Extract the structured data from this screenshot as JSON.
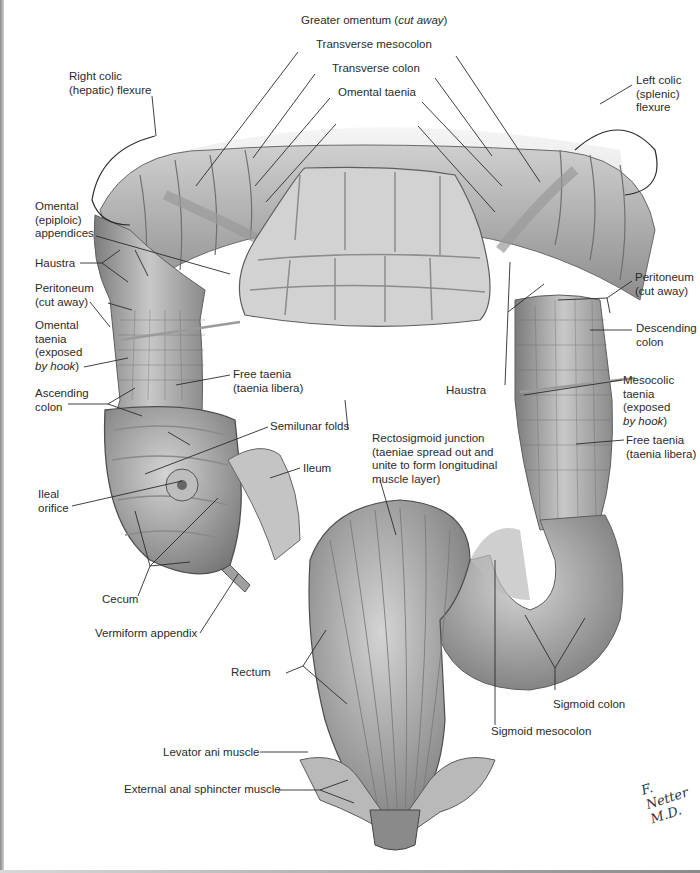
{
  "figure": {
    "signature": "F. Netter M.D.",
    "colors": {
      "background": "#ffffff",
      "ink": "#2b2b2b",
      "tissue_light": "#d9d9d9",
      "tissue_mid": "#a8a8a8",
      "tissue_dark": "#6e6e6e"
    }
  },
  "labels": {
    "greater_omentum": {
      "text": "Greater omentum (",
      "italic": "cut away",
      "suffix": ")"
    },
    "transverse_mesocolon": "Transverse mesocolon",
    "transverse_colon": "Transverse colon",
    "omental_taenia_top": "Omental taenia",
    "right_colic_flexure": {
      "line1": "Right colic",
      "line2": "(hepatic) flexure"
    },
    "left_colic_flexure": {
      "line1": "Left colic",
      "line2": "(splenic)",
      "line3": "flexure"
    },
    "omental_appendices": {
      "line1": "Omental",
      "line2": "(epiploic)",
      "line3": "appendices"
    },
    "haustra_left": "Haustra",
    "peritoneum_left": {
      "line1": "Peritoneum",
      "line2": "(cut away)"
    },
    "omental_taenia_left": {
      "line1": "Omental",
      "line2": "taenia",
      "line3": "(exposed",
      "line4_italic": "by hook",
      "line4_suffix": ")"
    },
    "free_taenia_left": {
      "line1": "Free taenia",
      "line2": "(taenia libera)"
    },
    "ascending_colon": {
      "line1": "Ascending",
      "line2": "colon"
    },
    "semilunar_folds": "Semilunar folds",
    "ileum": "Ileum",
    "ileal_orifice": {
      "line1": "Ileal",
      "line2": "orifice"
    },
    "cecum": "Cecum",
    "vermiform_appendix": "Vermiform appendix",
    "haustra_right": "Haustra",
    "peritoneum_right": {
      "line1": "Peritoneum",
      "line2": "(cut away)"
    },
    "descending_colon": {
      "line1": "Descending",
      "line2": "colon"
    },
    "mesocolic_taenia": {
      "line1": "Mesocolic",
      "line2": "taenia",
      "line3": "(exposed",
      "line4_italic": "by hook",
      "line4_suffix": ")"
    },
    "free_taenia_right": {
      "line1": "Free taenia",
      "line2": "(taenia libera)"
    },
    "rectosigmoid_junction": {
      "line1": "Rectosigmoid junction",
      "line2": "(taeniae spread out and",
      "line3": "unite to form longitudinal",
      "line4": "muscle layer)"
    },
    "rectum": "Rectum",
    "sigmoid_colon": "Sigmoid colon",
    "sigmoid_mesocolon": "Sigmoid mesocolon",
    "levator_ani": "Levator ani muscle",
    "external_anal_sphincter": "External anal sphincter muscle"
  }
}
